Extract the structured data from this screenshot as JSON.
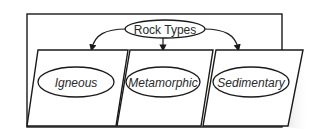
{
  "diagram": {
    "root": {
      "label": "Rock Types"
    },
    "children": [
      {
        "label": "Igneous"
      },
      {
        "label": "Metamorphic"
      },
      {
        "label": "Sedimentary"
      }
    ],
    "colors": {
      "stroke": "#1a1a1a",
      "fill": "#ffffff",
      "text": "#2a2a2a"
    }
  }
}
